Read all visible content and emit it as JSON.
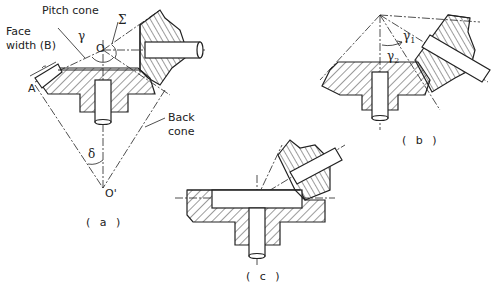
{
  "figure": {
    "subfigures": [
      {
        "id": "a",
        "caption": "( a )",
        "labels": {
          "pitch_cone": "Pitch cone",
          "face_width": "Face\nwidth (B)",
          "face_width_line1": "Face",
          "face_width_line2": "width (B)",
          "gamma": "γ",
          "sigma": "Σ",
          "apex": "O",
          "point_a": "A",
          "back_cone_line1": "Back",
          "back_cone_line2": "cone",
          "delta": "δ",
          "back_apex": "O'"
        }
      },
      {
        "id": "b",
        "caption": "( b )",
        "labels": {
          "gamma1": "γ",
          "gamma1_sub": "1",
          "gamma2": "γ",
          "gamma2_sub": "2"
        }
      },
      {
        "id": "c",
        "caption": "( c )",
        "labels": {}
      }
    ],
    "colors": {
      "line": "#222222",
      "background": "#ffffff"
    }
  }
}
